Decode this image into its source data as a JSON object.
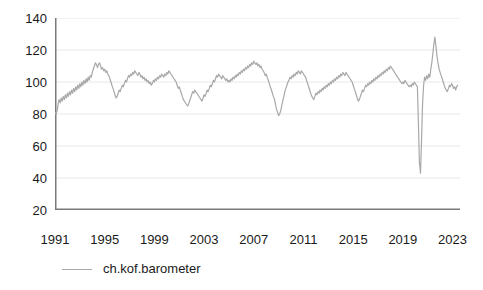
{
  "chart_data": {
    "type": "line",
    "title": "",
    "subtitle": "",
    "xlabel": "",
    "ylabel": "",
    "grid": true,
    "legend_position": "bottom-left",
    "xlim": [
      1991.0,
      2023.6
    ],
    "ylim": [
      20,
      140
    ],
    "y_ticks": [
      140,
      120,
      100,
      80,
      60,
      40,
      20
    ],
    "y_tick_labels": [
      "140",
      "120",
      "100",
      "80",
      "60",
      "40",
      "20"
    ],
    "x_ticks": [
      1991,
      1995,
      1999,
      2003,
      2007,
      2011,
      2015,
      2019,
      2023
    ],
    "x_tick_labels": [
      "1991",
      "1995",
      "1999",
      "2003",
      "2007",
      "2011",
      "2015",
      "2019",
      "2023"
    ],
    "x_minor_tick_interval": 0.25,
    "series": [
      {
        "name": "ch.kof.barometer",
        "color": "#a8a8a8",
        "x": [
          1991.0,
          1991.08,
          1991.17,
          1991.25,
          1991.33,
          1991.42,
          1991.5,
          1991.58,
          1991.67,
          1991.75,
          1991.83,
          1991.92,
          1992.0,
          1992.08,
          1992.17,
          1992.25,
          1992.33,
          1992.42,
          1992.5,
          1992.58,
          1992.67,
          1992.75,
          1992.83,
          1992.92,
          1993.0,
          1993.08,
          1993.17,
          1993.25,
          1993.33,
          1993.42,
          1993.5,
          1993.58,
          1993.67,
          1993.75,
          1993.83,
          1993.92,
          1994.0,
          1994.08,
          1994.17,
          1994.25,
          1994.33,
          1994.42,
          1994.5,
          1994.58,
          1994.67,
          1994.75,
          1994.83,
          1994.92,
          1995.0,
          1995.08,
          1995.17,
          1995.25,
          1995.33,
          1995.42,
          1995.5,
          1995.58,
          1995.67,
          1995.75,
          1995.83,
          1995.92,
          1996.0,
          1996.08,
          1996.17,
          1996.25,
          1996.33,
          1996.42,
          1996.5,
          1996.58,
          1996.67,
          1996.75,
          1996.83,
          1996.92,
          1997.0,
          1997.08,
          1997.17,
          1997.25,
          1997.33,
          1997.42,
          1997.5,
          1997.58,
          1997.67,
          1997.75,
          1997.83,
          1997.92,
          1998.0,
          1998.08,
          1998.17,
          1998.25,
          1998.33,
          1998.42,
          1998.5,
          1998.58,
          1998.67,
          1998.75,
          1998.83,
          1998.92,
          1999.0,
          1999.08,
          1999.17,
          1999.25,
          1999.33,
          1999.42,
          1999.5,
          1999.58,
          1999.67,
          1999.75,
          1999.83,
          1999.92,
          2000.0,
          2000.08,
          2000.17,
          2000.25,
          2000.33,
          2000.42,
          2000.5,
          2000.58,
          2000.67,
          2000.75,
          2000.83,
          2000.92,
          2001.0,
          2001.08,
          2001.17,
          2001.25,
          2001.33,
          2001.42,
          2001.5,
          2001.58,
          2001.67,
          2001.75,
          2001.83,
          2001.92,
          2002.0,
          2002.08,
          2002.17,
          2002.25,
          2002.33,
          2002.42,
          2002.5,
          2002.58,
          2002.67,
          2002.75,
          2002.83,
          2002.92,
          2003.0,
          2003.08,
          2003.17,
          2003.25,
          2003.33,
          2003.42,
          2003.5,
          2003.58,
          2003.67,
          2003.75,
          2003.83,
          2003.92,
          2004.0,
          2004.08,
          2004.17,
          2004.25,
          2004.33,
          2004.42,
          2004.5,
          2004.58,
          2004.67,
          2004.75,
          2004.83,
          2004.92,
          2005.0,
          2005.08,
          2005.17,
          2005.25,
          2005.33,
          2005.42,
          2005.5,
          2005.58,
          2005.67,
          2005.75,
          2005.83,
          2005.92,
          2006.0,
          2006.08,
          2006.17,
          2006.25,
          2006.33,
          2006.42,
          2006.5,
          2006.58,
          2006.67,
          2006.75,
          2006.83,
          2006.92,
          2007.0,
          2007.08,
          2007.17,
          2007.25,
          2007.33,
          2007.42,
          2007.5,
          2007.58,
          2007.67,
          2007.75,
          2007.83,
          2007.92,
          2008.0,
          2008.08,
          2008.17,
          2008.25,
          2008.33,
          2008.42,
          2008.5,
          2008.58,
          2008.67,
          2008.75,
          2008.83,
          2008.92,
          2009.0,
          2009.08,
          2009.17,
          2009.25,
          2009.33,
          2009.42,
          2009.5,
          2009.58,
          2009.67,
          2009.75,
          2009.83,
          2009.92,
          2010.0,
          2010.08,
          2010.17,
          2010.25,
          2010.33,
          2010.42,
          2010.5,
          2010.58,
          2010.67,
          2010.75,
          2010.83,
          2010.92,
          2011.0,
          2011.08,
          2011.17,
          2011.25,
          2011.33,
          2011.42,
          2011.5,
          2011.58,
          2011.67,
          2011.75,
          2011.83,
          2011.92,
          2012.0,
          2012.08,
          2012.17,
          2012.25,
          2012.33,
          2012.42,
          2012.5,
          2012.58,
          2012.67,
          2012.75,
          2012.83,
          2012.92,
          2013.0,
          2013.08,
          2013.17,
          2013.25,
          2013.33,
          2013.42,
          2013.5,
          2013.58,
          2013.67,
          2013.75,
          2013.83,
          2013.92,
          2014.0,
          2014.08,
          2014.17,
          2014.25,
          2014.33,
          2014.42,
          2014.5,
          2014.58,
          2014.67,
          2014.75,
          2014.83,
          2014.92,
          2015.0,
          2015.08,
          2015.17,
          2015.25,
          2015.33,
          2015.42,
          2015.5,
          2015.58,
          2015.67,
          2015.75,
          2015.83,
          2015.92,
          2016.0,
          2016.08,
          2016.17,
          2016.25,
          2016.33,
          2016.42,
          2016.5,
          2016.58,
          2016.67,
          2016.75,
          2016.83,
          2016.92,
          2017.0,
          2017.08,
          2017.17,
          2017.25,
          2017.33,
          2017.42,
          2017.5,
          2017.58,
          2017.67,
          2017.75,
          2017.83,
          2017.92,
          2018.0,
          2018.08,
          2018.17,
          2018.25,
          2018.33,
          2018.42,
          2018.5,
          2018.58,
          2018.67,
          2018.75,
          2018.83,
          2018.92,
          2019.0,
          2019.08,
          2019.17,
          2019.25,
          2019.33,
          2019.42,
          2019.5,
          2019.58,
          2019.67,
          2019.75,
          2019.83,
          2019.92,
          2020.0,
          2020.08,
          2020.17,
          2020.25,
          2020.33,
          2020.42,
          2020.5,
          2020.58,
          2020.67,
          2020.75,
          2020.83,
          2020.92,
          2021.0,
          2021.08,
          2021.17,
          2021.25,
          2021.33,
          2021.42,
          2021.5,
          2021.58,
          2021.67,
          2021.75,
          2021.83,
          2021.92,
          2022.0,
          2022.08,
          2022.17,
          2022.25,
          2022.33,
          2022.42,
          2022.5,
          2022.58,
          2022.67,
          2022.75,
          2022.83,
          2022.92,
          2023.0,
          2023.08,
          2023.17,
          2023.25,
          2023.33,
          2023.42
        ],
        "y": [
          81,
          80,
          82,
          86,
          89,
          87,
          90,
          88,
          91,
          89,
          92,
          90,
          93,
          91,
          94,
          92,
          95,
          93,
          96,
          94,
          97,
          95,
          98,
          96,
          99,
          97,
          100,
          98,
          101,
          99,
          102,
          100,
          103,
          101,
          104,
          103,
          106,
          108,
          110,
          112,
          111,
          109,
          111,
          112,
          110,
          108,
          109,
          107,
          108,
          106,
          107,
          105,
          104,
          102,
          100,
          98,
          96,
          94,
          92,
          90,
          91,
          93,
          95,
          94,
          96,
          98,
          97,
          99,
          101,
          100,
          102,
          104,
          103,
          105,
          104,
          106,
          105,
          107,
          106,
          105,
          104,
          106,
          105,
          103,
          104,
          102,
          103,
          101,
          102,
          100,
          101,
          99,
          100,
          98,
          99,
          101,
          100,
          102,
          101,
          103,
          102,
          104,
          103,
          105,
          104,
          103,
          105,
          104,
          106,
          105,
          107,
          106,
          105,
          104,
          103,
          102,
          101,
          100,
          98,
          96,
          97,
          95,
          93,
          91,
          89,
          88,
          87,
          86,
          85,
          86,
          88,
          90,
          92,
          94,
          93,
          95,
          94,
          93,
          92,
          91,
          90,
          89,
          88,
          90,
          92,
          91,
          93,
          95,
          94,
          96,
          98,
          97,
          99,
          101,
          100,
          102,
          104,
          103,
          105,
          104,
          103,
          102,
          104,
          103,
          102,
          101,
          102,
          100,
          101,
          100,
          102,
          101,
          103,
          102,
          104,
          103,
          105,
          104,
          106,
          105,
          107,
          106,
          108,
          107,
          109,
          108,
          110,
          109,
          111,
          110,
          112,
          111,
          113,
          112,
          111,
          112,
          110,
          111,
          109,
          110,
          108,
          107,
          106,
          104,
          105,
          103,
          101,
          99,
          97,
          95,
          93,
          91,
          89,
          86,
          83,
          81,
          79,
          80,
          82,
          85,
          88,
          91,
          94,
          96,
          98,
          100,
          101,
          103,
          102,
          104,
          103,
          105,
          104,
          106,
          105,
          107,
          106,
          105,
          107,
          106,
          105,
          104,
          103,
          101,
          99,
          97,
          95,
          93,
          91,
          90,
          89,
          91,
          93,
          92,
          94,
          93,
          95,
          94,
          96,
          95,
          97,
          96,
          98,
          97,
          99,
          98,
          100,
          99,
          101,
          100,
          102,
          101,
          103,
          102,
          104,
          103,
          105,
          104,
          106,
          105,
          104,
          106,
          105,
          104,
          103,
          102,
          101,
          100,
          98,
          96,
          94,
          92,
          90,
          88,
          89,
          91,
          93,
          95,
          94,
          96,
          98,
          97,
          99,
          98,
          100,
          99,
          101,
          100,
          102,
          101,
          103,
          102,
          104,
          103,
          105,
          104,
          106,
          105,
          107,
          106,
          108,
          107,
          109,
          108,
          110,
          109,
          108,
          107,
          106,
          105,
          104,
          103,
          102,
          101,
          100,
          99,
          100,
          99,
          101,
          100,
          99,
          98,
          97,
          98,
          97,
          99,
          98,
          100,
          99,
          98,
          97,
          75,
          50,
          43,
          62,
          85,
          98,
          103,
          101,
          104,
          102,
          105,
          103,
          108,
          112,
          118,
          124,
          128,
          122,
          116,
          112,
          108,
          106,
          104,
          102,
          100,
          98,
          96,
          95,
          94,
          96,
          98,
          97,
          99,
          98,
          96,
          97,
          95,
          97,
          98
        ]
      }
    ]
  },
  "axes": {
    "y_labels": [
      "140",
      "120",
      "100",
      "80",
      "60",
      "40",
      "20"
    ],
    "x_labels": [
      "1991",
      "1995",
      "1999",
      "2003",
      "2007",
      "2011",
      "2015",
      "2019",
      "2023"
    ]
  },
  "legend": {
    "entries": [
      {
        "label": "ch.kof.barometer",
        "color": "#a8a8a8"
      }
    ]
  },
  "colors": {
    "series": "#a8a8a8",
    "grid": "#e8e8e8",
    "axis": "#7a7a7a",
    "text": "#1a1a1a",
    "background": "#ffffff"
  }
}
